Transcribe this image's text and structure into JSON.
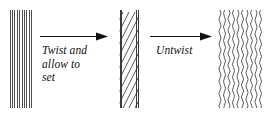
{
  "figure": {
    "background_color": "#ffffff",
    "line_color": "#222222",
    "text_color": "#111111"
  },
  "top_partial_text": {
    "visible_fragment": "",
    "note": "faint clipped descenders of a text line above the figure"
  },
  "stages": [
    {
      "id": "stage-1",
      "name": "untwisted-fiber-bundle",
      "pattern": "straight-vertical-lines",
      "line_count": 10,
      "x": 9,
      "y": 10,
      "width": 23,
      "height": 98
    },
    {
      "id": "stage-2",
      "name": "twisted-fiber-bundle",
      "pattern": "diagonal-hatch-lines",
      "line_count": 16,
      "x": 119,
      "y": 10,
      "width": 20,
      "height": 98
    },
    {
      "id": "stage-3",
      "name": "crimped-fiber-bundle",
      "pattern": "wavy-vertical-lines",
      "line_count": 10,
      "x": 218,
      "y": 10,
      "width": 44,
      "height": 98
    }
  ],
  "arrows": [
    {
      "id": "arrow-1",
      "name": "twist-arrow",
      "direction": "right",
      "x": 40,
      "y": 36,
      "length": 68
    },
    {
      "id": "arrow-2",
      "name": "untwist-arrow",
      "direction": "right",
      "x": 150,
      "y": 36,
      "length": 62
    }
  ],
  "labels": {
    "twist": {
      "name": "twist-and-allow-to-set-label",
      "lines": [
        "Twist and",
        "allow to",
        "set"
      ],
      "line1": "Twist and",
      "line2": "allow to",
      "line3": "set",
      "x": 42,
      "y": 46
    },
    "untwist": {
      "name": "untwist-label",
      "lines": [
        "Untwist"
      ],
      "line1": "Untwist",
      "x": 156,
      "y": 46
    }
  }
}
